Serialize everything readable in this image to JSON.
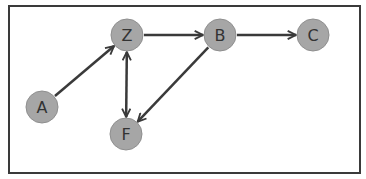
{
  "diagram": {
    "type": "directed-graph",
    "colors": {
      "node_fill": "#a6a6a6",
      "node_stroke": "#8f8f8f",
      "edge": "#3a3a3a",
      "label": "#333333",
      "border": "#3a3a3a"
    },
    "nodes": [
      {
        "id": "Z",
        "label": "Z",
        "x": 127,
        "y": 35
      },
      {
        "id": "B",
        "label": "B",
        "x": 220,
        "y": 35
      },
      {
        "id": "C",
        "label": "C",
        "x": 313,
        "y": 35
      },
      {
        "id": "A",
        "label": "A",
        "x": 42,
        "y": 107
      },
      {
        "id": "F",
        "label": "F",
        "x": 126,
        "y": 134
      }
    ],
    "edges": [
      {
        "from": "A",
        "to": "Z",
        "direction": "forward"
      },
      {
        "from": "Z",
        "to": "B",
        "direction": "forward"
      },
      {
        "from": "B",
        "to": "C",
        "direction": "forward"
      },
      {
        "from": "B",
        "to": "F",
        "direction": "forward"
      },
      {
        "from": "Z",
        "to": "F",
        "direction": "both"
      }
    ]
  }
}
